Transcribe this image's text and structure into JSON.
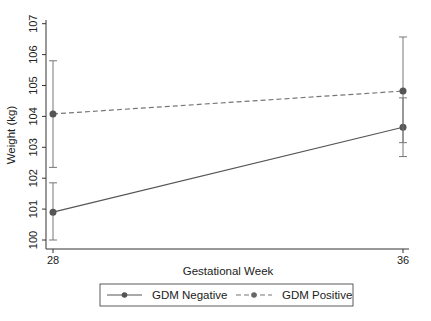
{
  "chart_data": {
    "type": "line",
    "title": "",
    "xlabel": "Gestational Week",
    "ylabel": "Weight (kg)",
    "x": [
      28,
      36
    ],
    "x_ticks": [
      "28",
      "36"
    ],
    "y_ticks": [
      "100",
      "101",
      "102",
      "103",
      "104",
      "105",
      "106",
      "107"
    ],
    "ylim": [
      99.7,
      107.1
    ],
    "grid": false,
    "legend_position": "bottom",
    "series": [
      {
        "name": "GDM Negative",
        "line_style": "solid",
        "color": "#555555",
        "values": [
          100.9,
          103.65
        ],
        "ci_lower": [
          100.0,
          102.7
        ],
        "ci_upper": [
          101.85,
          104.6
        ]
      },
      {
        "name": "GDM Positive",
        "line_style": "dashed",
        "color": "#777777",
        "values": [
          104.08,
          104.82
        ],
        "ci_lower": [
          102.35,
          103.15
        ],
        "ci_upper": [
          105.8,
          106.57
        ]
      }
    ]
  },
  "legend": {
    "items": [
      {
        "label": "GDM Negative"
      },
      {
        "label": "GDM Positive"
      }
    ]
  }
}
